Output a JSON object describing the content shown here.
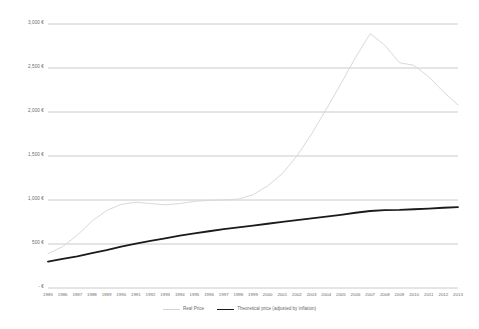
{
  "chart_data": {
    "type": "line",
    "title": "",
    "xlabel": "",
    "ylabel": "",
    "ylim": [
      0,
      3000
    ],
    "y_tick_labels": [
      "3,000 €",
      "2,500 €",
      "2,000 €",
      "1,500 €",
      "1,000 €",
      "500 €",
      "- €"
    ],
    "y_tick_values": [
      3000,
      2500,
      2000,
      1500,
      1000,
      500,
      0
    ],
    "grid": true,
    "legend_position": "bottom",
    "currency": "EUR",
    "x": [
      1985,
      1986,
      1987,
      1988,
      1989,
      1990,
      1991,
      1992,
      1993,
      1994,
      1995,
      1996,
      1997,
      1998,
      1999,
      2000,
      2001,
      2002,
      2003,
      2004,
      2005,
      2006,
      2007,
      2008,
      2009,
      2010,
      2011,
      2012,
      2013
    ],
    "x_tick_labels": [
      "1985",
      "1986",
      "1987",
      "1988",
      "1989",
      "1990",
      "1991",
      "1992",
      "1993",
      "1994",
      "1995",
      "1996",
      "1997",
      "1998",
      "1999",
      "2000",
      "2001",
      "2002",
      "2003",
      "2004",
      "2005",
      "2006",
      "2007",
      "2008",
      "2009",
      "2010",
      "2011",
      "2012",
      "2013"
    ],
    "series": [
      {
        "name": "Real Price",
        "color": "#d9d9d9",
        "width": 1,
        "values": [
          390,
          470,
          600,
          760,
          880,
          950,
          975,
          960,
          945,
          960,
          985,
          995,
          1000,
          1010,
          1060,
          1160,
          1300,
          1500,
          1750,
          2030,
          2320,
          2620,
          2890,
          2760,
          2560,
          2530,
          2400,
          2230,
          2080
        ]
      },
      {
        "name": "Theoretical price (adjusted by inflation)",
        "color": "#1a1a1a",
        "width": 1.8,
        "values": [
          300,
          330,
          360,
          395,
          430,
          470,
          505,
          535,
          565,
          595,
          620,
          645,
          668,
          690,
          710,
          730,
          752,
          772,
          792,
          812,
          832,
          855,
          875,
          885,
          888,
          895,
          903,
          912,
          920
        ]
      }
    ]
  }
}
